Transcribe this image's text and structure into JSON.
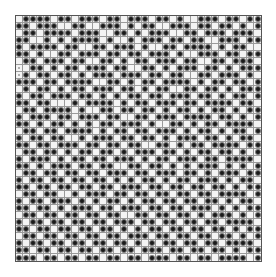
{
  "board": {
    "cols": 35,
    "rows": 35,
    "legend": {
      "0": "empty",
      "1": "filled-dot",
      "2": "light-marker"
    },
    "colors": {
      "dot": "#1a1a1a",
      "grid": "#9a9a9a",
      "border": "#555555",
      "cell": "#f4f4f4"
    },
    "cells": [
      "01111011011101101110110100111011011",
      "11011100110011101011001110110110101",
      "01101111011100110101110011011101110",
      "11001010111101001011101101100111011",
      "10111101100110111010011011110101100",
      "11010011011101101101110100111011011",
      "01101110110011010110111011001101110",
      "20110101101110110011010111011010111",
      "21011011010111011101101100110111010",
      "11101101111001101011011110101101101",
      "01011010110111011010110011011010111",
      "10110111011010101101101110110101101",
      "11011000101111010110111011011110110",
      "01101111010011011011010110101101011",
      "10111011011101100110111011110110101",
      "11010110101011011101001101011011110",
      "01101101111010110110111010110101101",
      "10110110010111011011010111011010110",
      "11011011101101101100110101101111011",
      "01101101011011010111011010110110101",
      "10111010110110111010110111011011110",
      "11010111011011001101101010111010101",
      "01101101101101110110111011010111011",
      "10110110110110101011010110111010110",
      "11011011011011011101101101101101011",
      "01101100101110110110110110110111101",
      "10110111010101101011011011011010110",
      "11011010111011011101101101110101011",
      "01101101101101100110110110101110101",
      "10110110110110111011011011011011110",
      "11011011011011010101101101101101011",
      "01101101101101101110110110110110101",
      "10110110110110110101011011011011110",
      "11011011011011011011101101101101011",
      "11101101101101101101110110110111101"
    ]
  }
}
